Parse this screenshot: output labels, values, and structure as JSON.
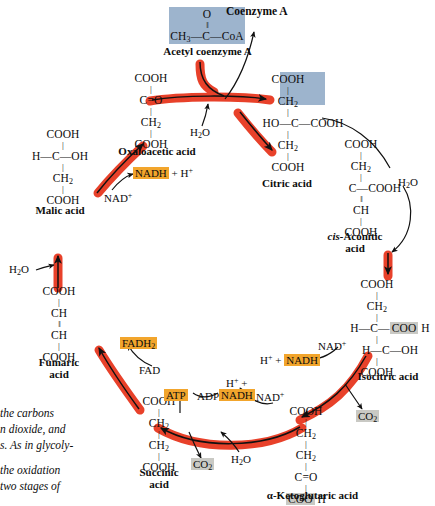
{
  "figure": {
    "colors": {
      "arrow_red": "#e8412a",
      "highlight_orange": "#f2a52c",
      "highlight_gray": "#c9c9c4",
      "substrate_blue": "#9db4cd",
      "text": "#0d0d0d",
      "background": "#ffffff"
    }
  },
  "molecules": {
    "acetyl_coa": {
      "label": "Acetyl coenzyme A",
      "formula_top": "O",
      "formula_dbond": "‖",
      "formula_main_left": "CH",
      "formula_main_left_sub": "3",
      "formula_main_mid": "—C—",
      "formula_main_right": "CoA"
    },
    "oxaloacetic_acid": {
      "label": "Oxaloacetic acid",
      "rows": [
        "COOH",
        "C═O",
        "CH2",
        "COOH"
      ]
    },
    "citric_acid": {
      "label": "Citric acid",
      "rows": [
        "COOH",
        "CH2",
        "HO—C—COOH",
        "CH2",
        "COOH"
      ]
    },
    "cis_aconitic_acid": {
      "label_italic": "cis-",
      "label_rest": "Aconitic",
      "label_line2": "acid",
      "rows": [
        "COOH",
        "CH2",
        "C—COOH",
        "CH",
        "COOH"
      ]
    },
    "isocitric_acid": {
      "label": "Isocitric acid",
      "rows": [
        "COOH",
        "CH2",
        "H—C—COO H",
        "H—C—OH",
        "COOH"
      ],
      "highlight": "COO H"
    },
    "alpha_ketoglutaric_acid": {
      "label": "α-Ketoglutaric acid",
      "rows": [
        "COOH",
        "CH2",
        "CH2",
        "C═O",
        "COO H"
      ],
      "highlight": "COO H"
    },
    "succinic_acid": {
      "label_line1": "Succinic",
      "label_line2": "acid",
      "rows": [
        "COOH",
        "CH2",
        "CH2",
        "COOH"
      ]
    },
    "fumaric_acid": {
      "label_line1": "Fumaric",
      "label_line2": "acid",
      "rows": [
        "COOH",
        "CH",
        "CH",
        "COOH"
      ]
    },
    "malic_acid": {
      "label": "Malic acid",
      "rows": [
        "COOH",
        "H—C—OH",
        "CH2",
        "COOH"
      ]
    }
  },
  "labels": {
    "coenzyme_a": "Coenzyme A",
    "water_top": "H2O",
    "water_right": "H2O",
    "water_left": "H2O",
    "water_bottom": "H2O",
    "nad_plus_oxaloacetic": "NAD+",
    "nadh_oxaloacetic": "NADH",
    "plus_h_oxaloacetic": "+ H+",
    "nad_plus_isocitric": "NAD+",
    "h_plus_isocitric": "H+ +",
    "nadh_isocitric": "NADH",
    "co2_isocitric": "CO2",
    "nad_plus_ketoglutaric": "NAD+",
    "h_plus_ketoglutaric": "H+ +",
    "nadh_ketoglutaric": "NADH",
    "co2_ketoglutaric": "CO2",
    "atp": "ATP",
    "adp": "ADP",
    "fad": "FAD",
    "fadh2": "FADH2"
  },
  "caption": {
    "line1": "the carbons",
    "line2": "n dioxide, and",
    "line3": "s. As in glycoly-",
    "line4": "the oxidation",
    "line5": "two stages of"
  }
}
